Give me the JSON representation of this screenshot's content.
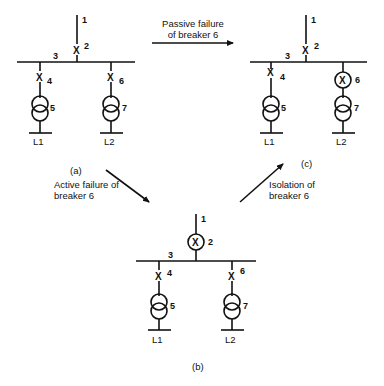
{
  "diagrams": {
    "a": {
      "caption": "(a)",
      "labels": {
        "feeder": "1",
        "breaker_feeder": "2",
        "busbar": "3",
        "breaker_left": "4",
        "transformer_left": "5",
        "breaker_right": "6",
        "transformer_right": "7",
        "load_left": "L1",
        "load_right": "L2"
      },
      "breaker_marks": {
        "b2": "X",
        "b4": "X",
        "b6": "X"
      }
    },
    "b": {
      "caption": "(b)",
      "labels": {
        "feeder": "1",
        "breaker_feeder": "2",
        "busbar": "3",
        "breaker_left": "4",
        "transformer_left": "5",
        "breaker_right": "6",
        "transformer_right": "7",
        "load_left": "L1",
        "load_right": "L2"
      },
      "breaker_marks": {
        "b2": "X",
        "b4": "X",
        "b6": "X"
      },
      "highlighted_breaker": "2"
    },
    "c": {
      "caption": "(c)",
      "labels": {
        "feeder": "1",
        "breaker_feeder": "2",
        "busbar": "3",
        "breaker_left": "4",
        "transformer_left": "5",
        "breaker_right": "6",
        "transformer_right": "7",
        "load_left": "L1",
        "load_right": "L2"
      },
      "breaker_marks": {
        "b2": "X",
        "b4": "X",
        "b6": "X"
      },
      "highlighted_breaker": "6"
    }
  },
  "transitions": {
    "a_to_c": {
      "line1": "Passive failure",
      "line2": "of breaker 6"
    },
    "a_to_b": {
      "line1": "Active failure of",
      "line2": "breaker 6"
    },
    "b_to_c": {
      "line1": "Isolation of",
      "line2": "breaker 6"
    }
  }
}
